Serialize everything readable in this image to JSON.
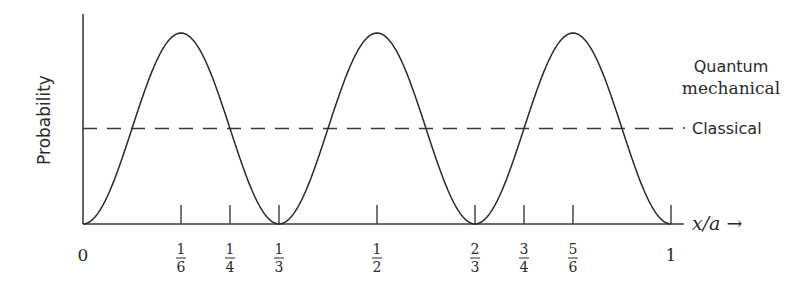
{
  "chart_data": {
    "type": "line",
    "title": "",
    "xlabel": "x/a →",
    "ylabel": "Probability",
    "xlim": [
      0,
      1
    ],
    "ylim": [
      0,
      1
    ],
    "grid": false,
    "legend_position": "inline-right",
    "x_ticks": [
      {
        "value": 0,
        "label": "0",
        "kind": "plain"
      },
      {
        "value": 0.1667,
        "num": "1",
        "den": "6",
        "kind": "fraction"
      },
      {
        "value": 0.25,
        "num": "1",
        "den": "4",
        "kind": "fraction"
      },
      {
        "value": 0.3333,
        "num": "1",
        "den": "3",
        "kind": "fraction"
      },
      {
        "value": 0.5,
        "num": "1",
        "den": "2",
        "kind": "fraction"
      },
      {
        "value": 0.6667,
        "num": "2",
        "den": "3",
        "kind": "fraction"
      },
      {
        "value": 0.75,
        "num": "3",
        "den": "4",
        "kind": "fraction"
      },
      {
        "value": 0.8333,
        "num": "5",
        "den": "6",
        "kind": "fraction"
      },
      {
        "value": 1,
        "label": "1",
        "kind": "plain"
      }
    ],
    "series": [
      {
        "name": "Quantum mechanical",
        "style": "solid",
        "formula": "sin^2(3*pi*x/a)",
        "peaks_at": [
          0.1667,
          0.5,
          0.8333
        ],
        "zeros_at": [
          0,
          0.3333,
          0.6667,
          1
        ],
        "peak_value": 1.0
      },
      {
        "name": "Classical",
        "style": "dashed",
        "constant_value": 0.5
      }
    ],
    "annotations": [
      {
        "text_line1": "Quantum",
        "text_line2": "mechanical",
        "target": "Quantum mechanical"
      },
      {
        "text": "Classical",
        "target": "Classical"
      }
    ]
  },
  "labels": {
    "ylabel": "Probability",
    "xlabel": "x/a →",
    "quantum_line1": "Quantum",
    "quantum_line2": "mechanical",
    "classical": "Classical"
  },
  "layout": {
    "x0_px": 83,
    "x1_px": 671,
    "axis_end_px": 684,
    "baseline_px": 224,
    "axis_top_px": 14,
    "peak_px": 33
  }
}
